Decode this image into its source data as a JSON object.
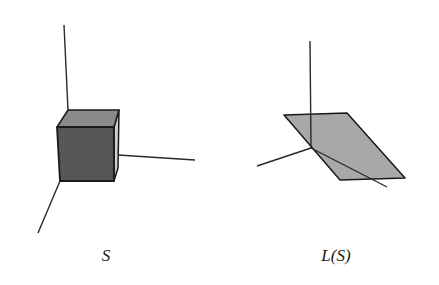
{
  "figure": {
    "left_panel": {
      "label": "S",
      "description": "unit cube at origin with coordinate axes",
      "colors": {
        "front": "#585858",
        "top": "#8a8a8a",
        "right": "#cfcfcf",
        "edge": "#1a1a1a",
        "axis": "#2a2a2a"
      }
    },
    "right_panel": {
      "label": "L(S)",
      "description": "image of cube under linear map L: a flat parallelogram",
      "colors": {
        "fill": "#a8a8a8",
        "edge": "#1a1a1a",
        "axis": "#2a2a2a"
      }
    }
  }
}
